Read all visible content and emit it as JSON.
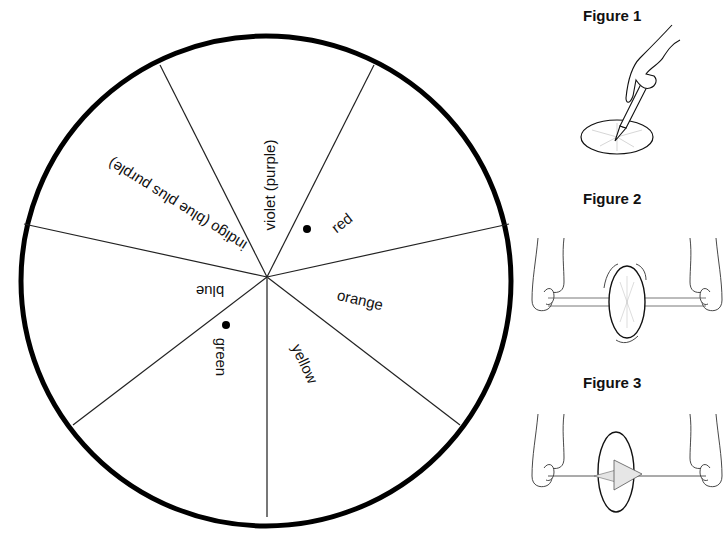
{
  "wheel": {
    "center": [
      266,
      279
    ],
    "radius": 246,
    "outline_color": "#000000",
    "segments": [
      {
        "label": "red",
        "has_dot": true
      },
      {
        "label": "orange",
        "has_dot": false
      },
      {
        "label": "yellow",
        "has_dot": false
      },
      {
        "label": "green",
        "has_dot": true
      },
      {
        "label": "blue",
        "has_dot": false
      },
      {
        "label": "indigo (blue plus purple)",
        "has_dot": false
      },
      {
        "label": "violet (purple)",
        "has_dot": false
      }
    ]
  },
  "figures": [
    {
      "title": "Figure 1",
      "caption_hidden": "hand pushing pencil through center of disk"
    },
    {
      "title": "Figure 2",
      "caption_hidden": "disk spinning on twisted string held between two hands"
    },
    {
      "title": "Figure 3",
      "caption_hidden": "string pulled taut, disk spinning and blurring"
    }
  ]
}
